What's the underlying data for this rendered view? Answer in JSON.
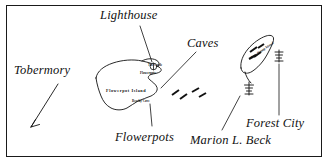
{
  "map": {
    "kind": "hand-drawn-nautical-map",
    "region": "Fathom Five / Flowerpot Island area, Georgian Bay",
    "background_color": "#ffffff",
    "ink_color": "#111111",
    "border": {
      "present": true,
      "color": "#1a1a1a",
      "width_px": 1
    },
    "labels": {
      "lighthouse": "Lighthouse",
      "caves": "Caves",
      "tobermory": "Tobermory",
      "flowerpots": "Flowerpots",
      "marion_l_beck": "Marion L. Beck",
      "forest_city": "Forest City"
    },
    "island_labels": {
      "flowerpot_island": "Flowerpot Island",
      "the_castle": "The Castle",
      "flowerpots_small": "Flowerpots",
      "beachy_cove": "Beachy Cove",
      "bear_rump_island": "Bear Rump Island"
    },
    "features": [
      {
        "name": "flowerpot-island",
        "type": "island",
        "label": "Flowerpot Island"
      },
      {
        "name": "bear-rump-island",
        "type": "island",
        "label": "Bear Rump Island"
      },
      {
        "name": "lighthouse-marker",
        "type": "point-marker"
      },
      {
        "name": "marion-l-beck-wreck",
        "type": "shipwreck-symbol"
      },
      {
        "name": "forest-city-wreck",
        "type": "shipwreck-symbol"
      },
      {
        "name": "caves-shoal-marks",
        "type": "hatch-marks"
      },
      {
        "name": "tobermory-arrow",
        "type": "direction-arrow",
        "points": "south-west"
      }
    ],
    "leader_lines": [
      {
        "from": "lighthouse",
        "to": "lighthouse-marker"
      },
      {
        "from": "caves",
        "to": "flowerpot-island-south-shore"
      },
      {
        "from": "flowerpots",
        "to": "flowerpot-island-east-shore"
      },
      {
        "from": "marion-l-beck",
        "to": "marion-l-beck-wreck"
      },
      {
        "from": "forest-city",
        "to": "forest-city-wreck"
      }
    ]
  }
}
